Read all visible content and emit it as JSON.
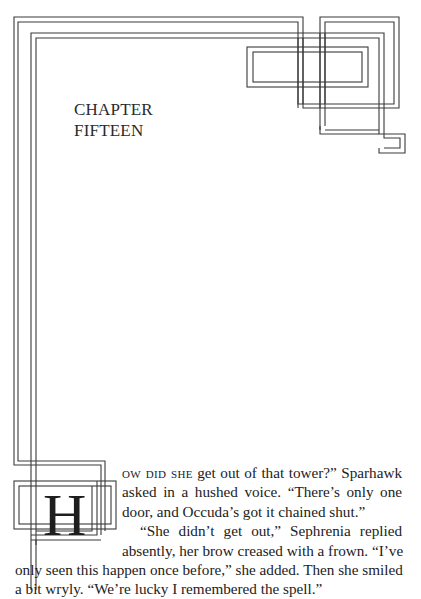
{
  "chapter": {
    "title_line1": "CHAPTER",
    "title_line2": "FIFTEEN"
  },
  "ornament": {
    "line_color": "#3a3a3a",
    "dropcap_letter": "H"
  },
  "body": {
    "lead_smallcaps": "ow did she",
    "lines": [
      " get out of that tower?” Sparhawk",
      "asked in a hushed voice. “There’s only one",
      "door, and Occuda’s got it chained shut.”",
      "“She didn’t get out,” Sephrenia replied",
      "absently, her brow creased with a frown. “I’ve",
      "only seen this happen once before,” she added. Then she smiled",
      "a bit wryly. “We’re lucky I remembered the spell.”"
    ]
  }
}
